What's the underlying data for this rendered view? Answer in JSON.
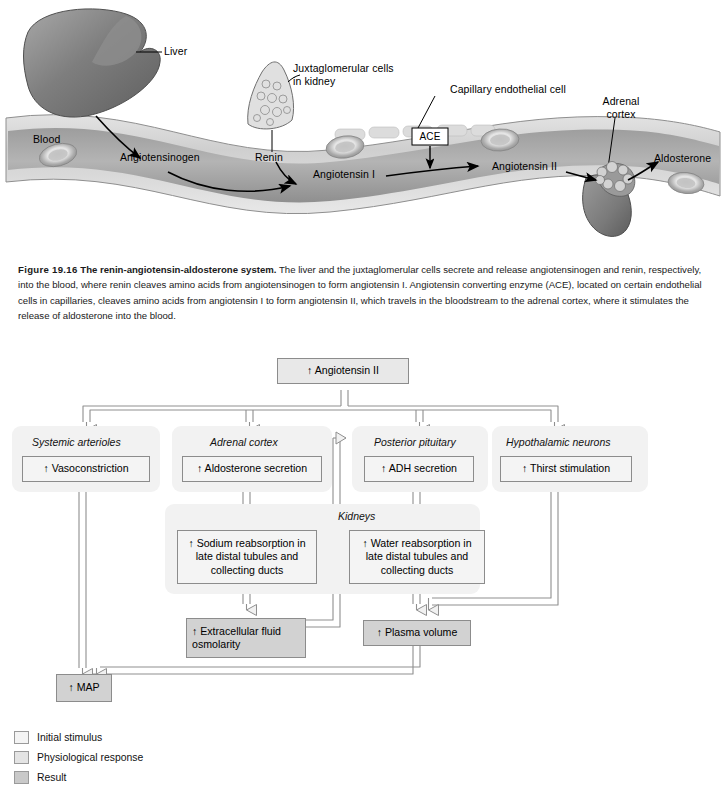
{
  "figure": {
    "number": "Figure 19.16",
    "title": "The renin-angiotensin-aldosterone system.",
    "caption_body": " The liver and the juxtaglomerular cells secrete and release angiotensinogen and renin, respectively, into the blood, where renin cleaves amino acids from angiotensinogen to form angiotensin I. Angiotensin converting enzyme (ACE), located on certain endothelial cells in capillaries, cleaves amino acids from angiotensin I to form angiotensin II, which travels in the bloodstream to the adrenal cortex, where it stimulates the release of aldosterone into the blood."
  },
  "illustration": {
    "labels": {
      "liver": "Liver",
      "juxtaglomerular": "Juxtaglomerular cells in kidney",
      "capillary": "Capillary endothelial cell",
      "adrenal_cortex": "Adrenal cortex",
      "blood": "Blood",
      "angiotensinogen": "Angiotensinogen",
      "renin": "Renin",
      "ace": "ACE",
      "angiotensin_i": "Angiotensin I",
      "angiotensin_ii": "Angiotensin II",
      "aldosterone": "Aldosterone"
    }
  },
  "flowchart": {
    "top_node": "↑ Angiotensin II",
    "groups": [
      {
        "label": "Systemic arterioles"
      },
      {
        "label": "Adrenal cortex"
      },
      {
        "label": "Posterior pituitary"
      },
      {
        "label": "Hypothalamic neurons"
      },
      {
        "label": "Kidneys"
      }
    ],
    "nodes": {
      "vasoconstriction": "↑ Vasoconstriction",
      "aldosterone_secretion": "↑ Aldosterone secretion",
      "adh_secretion": "↑ ADH secretion",
      "thirst_stimulation": "↑ Thirst stimulation",
      "sodium_reabsorption": "↑ Sodium reabsorption in late distal tubules and collecting ducts",
      "water_reabsorption": "↑ Water reabsorption in late distal tubules and collecting ducts",
      "ecf_osmolarity": "↑ Extracellular fluid osmolarity",
      "plasma_volume": "↑ Plasma volume",
      "map": "↑ MAP"
    }
  },
  "legend": {
    "items": [
      {
        "label": "Initial stimulus",
        "color": "#f4f4f4"
      },
      {
        "label": "Physiological response",
        "color": "#e4e4e4"
      },
      {
        "label": "Result",
        "color": "#c9c9c9"
      }
    ]
  }
}
